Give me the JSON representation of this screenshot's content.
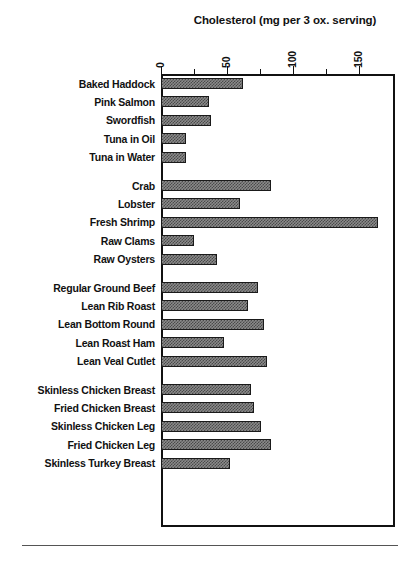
{
  "chart_data": {
    "type": "bar",
    "orientation": "horizontal",
    "title": "Cholesterol (mg per 3 ox. serving)",
    "xlabel": "",
    "ylabel": "",
    "xlim": [
      0,
      177
    ],
    "xticks": [
      0,
      50,
      100,
      150
    ],
    "xtick_labels": [
      "0",
      "50",
      "100",
      "150"
    ],
    "minor_xticks": [
      25,
      75,
      125
    ],
    "grid": false,
    "legend": false,
    "axis_position": "top",
    "categories": [
      "Baked Haddock",
      "Pink Salmon",
      "Swordfish",
      "Tuna in Oil",
      "Tuna in Water",
      "Crab",
      "Lobster",
      "Fresh Shrimp",
      "Raw Clams",
      "Raw Oysters",
      "Regular Ground Beef",
      "Lean Rib Roast",
      "Lean Bottom Round",
      "Lean Roast Ham",
      "Lean Veal Cutlet",
      "Skinless Chicken Breast",
      "Fried Chicken Breast",
      "Skinless Chicken Leg",
      "Fried Chicken Leg",
      "Skinless Turkey Breast"
    ],
    "values": [
      62,
      36,
      38,
      19,
      19,
      83,
      60,
      164,
      25,
      42,
      73,
      66,
      78,
      48,
      80,
      68,
      70,
      76,
      83,
      52
    ],
    "groups": [
      {
        "name": "Fish",
        "start": 0,
        "count": 5
      },
      {
        "name": "Shellfish",
        "start": 5,
        "count": 5
      },
      {
        "name": "Meats",
        "start": 10,
        "count": 5
      },
      {
        "name": "Poultry",
        "start": 15,
        "count": 5
      }
    ],
    "bar_color": "#8a8a8a",
    "bar_edge_color": "#1a1a1a",
    "frame_color": "#111111",
    "background": "#ffffff"
  }
}
